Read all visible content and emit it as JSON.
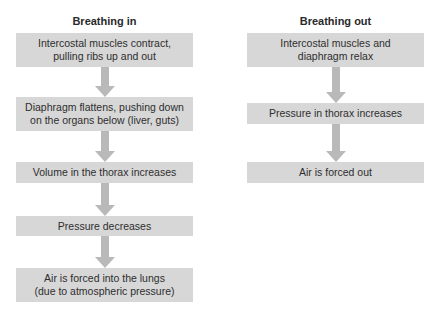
{
  "diagram": {
    "left": {
      "title": "Breathing in",
      "steps": [
        "Intercostal muscles contract,\npulling ribs up and out",
        "Diaphragm flattens, pushing down\non the organs below (liver, guts)",
        "Volume in the thorax increases",
        "Pressure decreases",
        "Air is forced into the lungs\n(due to atmospheric pressure)"
      ]
    },
    "right": {
      "title": "Breathing out",
      "steps": [
        "Intercostal muscles and\ndiaphragm relax",
        "Pressure in thorax increases",
        "Air is forced out"
      ]
    },
    "colors": {
      "box_fill": "#d7d7d7",
      "arrow": "#b9b9b9",
      "text": "#2e2e2e"
    }
  }
}
